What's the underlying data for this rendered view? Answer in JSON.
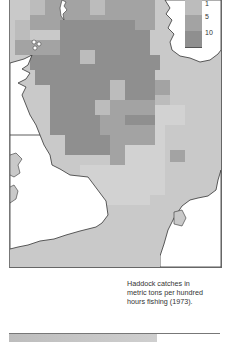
{
  "map": {
    "title": "Haddock catches map, North Sea",
    "colors": {
      "sea_base": "#c9c9c9",
      "land": "#ffffff",
      "level_low": "#bcbcbc",
      "level_mid": "#a3a3a3",
      "level_high": "#8f8f8f",
      "level_lightest": "#d2d2d2"
    },
    "legend": {
      "labels": [
        "1",
        "5",
        "10"
      ]
    },
    "caption": {
      "line1": "Haddock catches in",
      "line2": "metric tons per hundred",
      "line3": "hours fishing (1973)."
    },
    "grid_cells": [
      {
        "x": 20,
        "y": 0,
        "w": 15,
        "h": 15,
        "level": "low"
      },
      {
        "x": 35,
        "y": 0,
        "w": 45,
        "h": 15,
        "level": "mid"
      },
      {
        "x": 80,
        "y": 0,
        "w": 15,
        "h": 15,
        "level": "low"
      },
      {
        "x": 95,
        "y": 0,
        "w": 30,
        "h": 15,
        "level": "mid"
      },
      {
        "x": 125,
        "y": 0,
        "w": 20,
        "h": 30,
        "level": "mid"
      },
      {
        "x": 20,
        "y": 15,
        "w": 105,
        "h": 15,
        "level": "mid"
      },
      {
        "x": 5,
        "y": 20,
        "w": 15,
        "h": 20,
        "level": "low"
      },
      {
        "x": 5,
        "y": 40,
        "w": 45,
        "h": 15,
        "level": "mid"
      },
      {
        "x": 50,
        "y": 20,
        "w": 75,
        "h": 35,
        "level": "high"
      },
      {
        "x": 125,
        "y": 30,
        "w": 15,
        "h": 25,
        "level": "high"
      },
      {
        "x": 20,
        "y": 55,
        "w": 130,
        "h": 15,
        "level": "high"
      },
      {
        "x": 70,
        "y": 50,
        "w": 15,
        "h": 14,
        "level": "low"
      },
      {
        "x": 25,
        "y": 70,
        "w": 120,
        "h": 15,
        "level": "high"
      },
      {
        "x": 40,
        "y": 85,
        "w": 60,
        "h": 15,
        "level": "high"
      },
      {
        "x": 100,
        "y": 80,
        "w": 15,
        "h": 20,
        "level": "low"
      },
      {
        "x": 115,
        "y": 80,
        "w": 30,
        "h": 20,
        "level": "high"
      },
      {
        "x": 145,
        "y": 80,
        "w": 15,
        "h": 15,
        "level": "mid"
      },
      {
        "x": 145,
        "y": 95,
        "w": 15,
        "h": 10,
        "level": "low"
      },
      {
        "x": 40,
        "y": 100,
        "w": 45,
        "h": 15,
        "level": "high"
      },
      {
        "x": 85,
        "y": 100,
        "w": 15,
        "h": 15,
        "level": "low"
      },
      {
        "x": 100,
        "y": 100,
        "w": 45,
        "h": 15,
        "level": "mid"
      },
      {
        "x": 145,
        "y": 105,
        "w": 30,
        "h": 20,
        "level": "lightest"
      },
      {
        "x": 40,
        "y": 115,
        "w": 50,
        "h": 20,
        "level": "high"
      },
      {
        "x": 90,
        "y": 115,
        "w": 25,
        "h": 10,
        "level": "mid"
      },
      {
        "x": 115,
        "y": 115,
        "w": 30,
        "h": 15,
        "level": "high"
      },
      {
        "x": 90,
        "y": 125,
        "w": 55,
        "h": 20,
        "level": "mid"
      },
      {
        "x": 145,
        "y": 125,
        "w": 10,
        "h": 25,
        "level": "lightest"
      },
      {
        "x": 55,
        "y": 135,
        "w": 45,
        "h": 20,
        "level": "high"
      },
      {
        "x": 100,
        "y": 135,
        "w": 15,
        "h": 30,
        "level": "mid"
      },
      {
        "x": 115,
        "y": 145,
        "w": 40,
        "h": 30,
        "level": "lightest"
      },
      {
        "x": 160,
        "y": 150,
        "w": 15,
        "h": 12,
        "level": "mid"
      },
      {
        "x": 70,
        "y": 165,
        "w": 85,
        "h": 30,
        "level": "lightest"
      },
      {
        "x": 70,
        "y": 195,
        "w": 70,
        "h": 10,
        "level": "lightest"
      }
    ]
  }
}
